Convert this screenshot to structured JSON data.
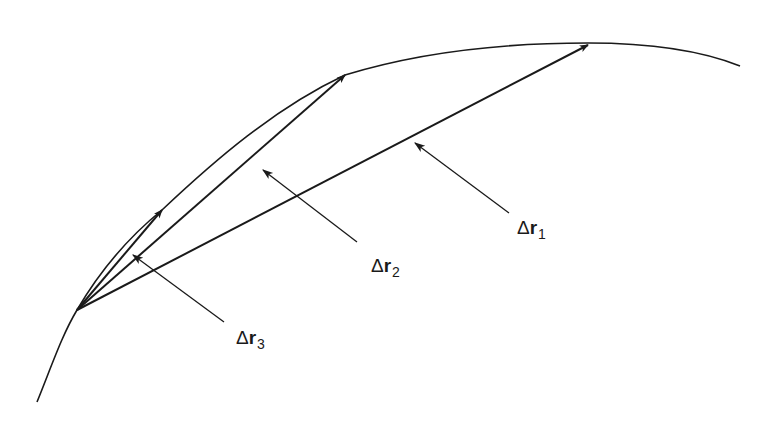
{
  "diagram": {
    "title": "",
    "colors": {
      "stroke": "#1a1a1a",
      "background": "#ffffff"
    },
    "curve": {
      "name": "trajectory-path"
    },
    "origin": {
      "x": 77,
      "y": 310
    },
    "vectors": [
      {
        "id": "dr1",
        "delta": "Δ",
        "symbol": "r",
        "subscript": "1",
        "tip": {
          "x": 588,
          "y": 45
        }
      },
      {
        "id": "dr2",
        "delta": "Δ",
        "symbol": "r",
        "subscript": "2",
        "tip": {
          "x": 345,
          "y": 75
        }
      },
      {
        "id": "dr3",
        "delta": "Δ",
        "symbol": "r",
        "subscript": "3",
        "tip": {
          "x": 162,
          "y": 210
        }
      }
    ]
  }
}
